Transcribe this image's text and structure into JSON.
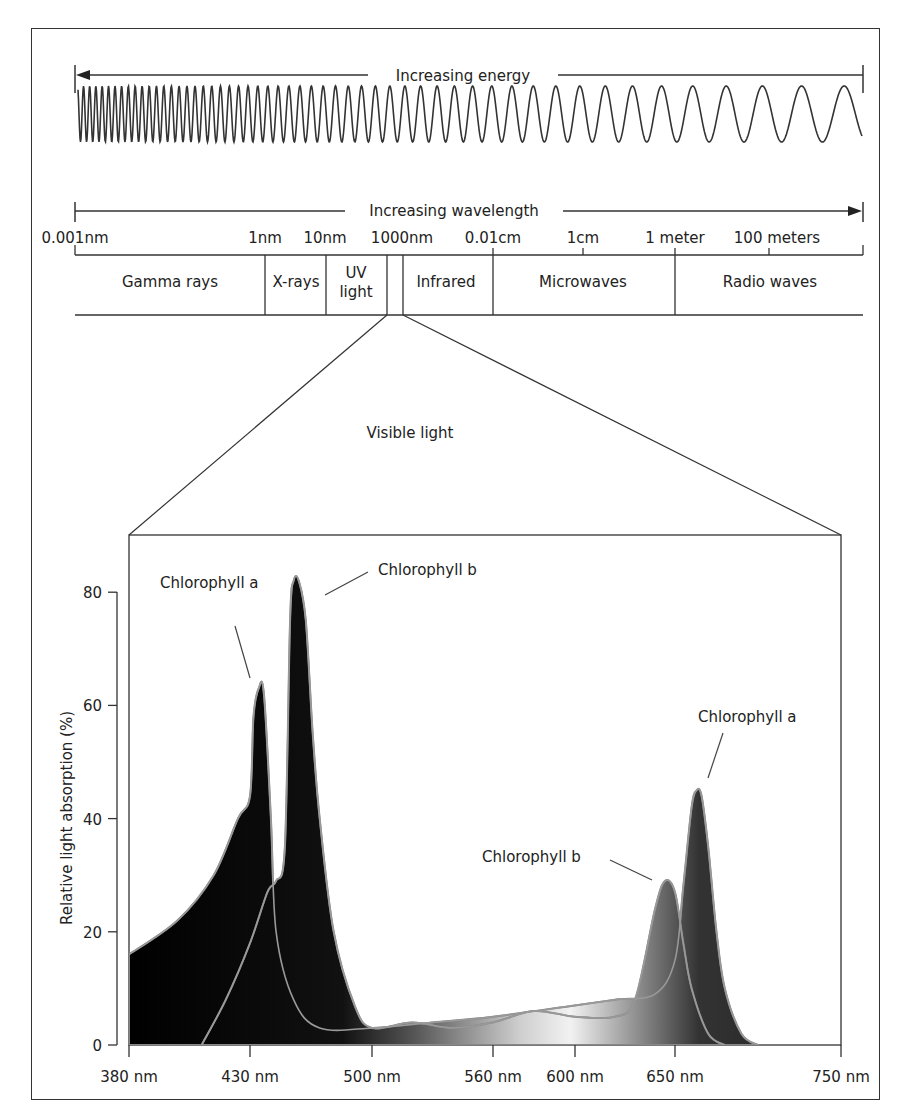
{
  "spectrum": {
    "energy_label": "Increasing energy",
    "wavelength_label": "Increasing wavelength",
    "scale_labels": [
      {
        "text": "0.001nm",
        "x": 75
      },
      {
        "text": "1nm",
        "x": 265
      },
      {
        "text": "10nm",
        "x": 325
      },
      {
        "text": "1000nm",
        "x": 402
      },
      {
        "text": "0.01cm",
        "x": 493
      },
      {
        "text": "1cm",
        "x": 583
      },
      {
        "text": "1 meter",
        "x": 675
      },
      {
        "text": "100 meters",
        "x": 777
      }
    ],
    "bands": [
      {
        "label": "Gamma rays"
      },
      {
        "label": "X-rays"
      },
      {
        "label_line1": "UV",
        "label_line2": "light"
      },
      {
        "label": "Infrared"
      },
      {
        "label": "Microwaves"
      },
      {
        "label": "Radio waves"
      }
    ],
    "visible_label": "Visible light"
  },
  "chart_data": {
    "type": "area",
    "xlabel": "Wavelength (nm)",
    "ylabel": "Relative light absorption (%)",
    "x_ticks": [
      "380 nm",
      "430 nm",
      "500 nm",
      "560 nm",
      "600 nm",
      "650 nm",
      "750 nm"
    ],
    "y_ticks": [
      "0",
      "20",
      "40",
      "60",
      "80"
    ],
    "xlim": [
      380,
      750
    ],
    "ylim": [
      0,
      90
    ],
    "grid": false,
    "series": [
      {
        "name": "Chlorophyll a",
        "x": [
          380,
          400,
          415,
          425,
          430,
          432,
          435,
          438,
          442,
          445,
          455,
          470,
          500,
          530,
          560,
          600,
          620,
          640,
          650,
          655,
          660,
          663,
          666,
          670,
          675,
          680,
          690,
          700
        ],
        "values": [
          16,
          22,
          30,
          40,
          44,
          58,
          63,
          62,
          40,
          20,
          8,
          3,
          3,
          4,
          5,
          7,
          8,
          9,
          15,
          28,
          42,
          45,
          44,
          35,
          20,
          10,
          2,
          0
        ]
      },
      {
        "name": "Chlorophyll b",
        "x": [
          410,
          420,
          430,
          440,
          445,
          450,
          453,
          455,
          458,
          462,
          466,
          470,
          478,
          490,
          500,
          520,
          540,
          560,
          580,
          600,
          620,
          630,
          640,
          645,
          650,
          655,
          660,
          670,
          680
        ],
        "values": [
          0,
          8,
          18,
          27,
          29,
          35,
          75,
          82,
          82,
          75,
          55,
          40,
          20,
          7,
          3,
          4,
          3,
          4,
          6,
          5,
          5,
          8,
          24,
          29,
          27,
          18,
          10,
          2,
          0
        ]
      }
    ],
    "annotations": [
      {
        "text": "Chlorophyll a",
        "near": "430 nm peak (~63%)"
      },
      {
        "text": "Chlorophyll b",
        "near": "455 nm peak (~82%)"
      },
      {
        "text": "Chlorophyll b",
        "near": "645 nm peak (~29%)"
      },
      {
        "text": "Chlorophyll a",
        "near": "663 nm peak (~45%)"
      }
    ]
  },
  "chart_labels": {
    "ylabel": "Relative light absorption (%)",
    "annot_a_blue": "Chlorophyll a",
    "annot_b_blue": "Chlorophyll b",
    "annot_b_red": "Chlorophyll b",
    "annot_a_red": "Chlorophyll a"
  }
}
